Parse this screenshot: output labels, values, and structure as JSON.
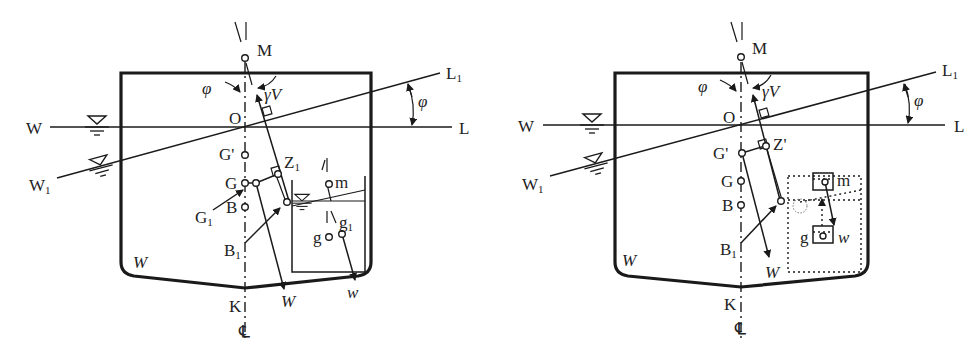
{
  "figures": [
    {
      "id": "left",
      "description": "Ship heeled with free-surface liquid tank (tank with sloshing liquid)",
      "labels": {
        "M": "M",
        "O": "O",
        "W": "W",
        "L": "L",
        "W1": "W",
        "W1_sub": "1",
        "L1": "L",
        "L1_sub": "1",
        "phi_left": "φ",
        "phi_right": "φ",
        "gammaV": "γV",
        "Gp": "G'",
        "G": "G",
        "G1": "G",
        "G1_sub": "1",
        "B": "B",
        "B1": "B",
        "B1_sub": "1",
        "Z1": "Z",
        "Z1_sub": "1",
        "m": "m",
        "g": "g",
        "g1": "g",
        "g1_sub": "1",
        "W_weight": "W",
        "w_weight": "w",
        "W_hull": "W",
        "K": "K",
        "CL": "℄"
      }
    },
    {
      "id": "right",
      "description": "Ship heeled with equivalent raised weight (free surface treated as weight shifted from g to m)",
      "labels": {
        "M": "M",
        "O": "O",
        "W": "W",
        "L": "L",
        "W1": "W",
        "W1_sub": "1",
        "L1": "L",
        "L1_sub": "1",
        "phi_left": "φ",
        "phi_right": "φ",
        "gammaV": "γV",
        "Gp": "G'",
        "G": "G",
        "B": "B",
        "B1": "B",
        "B1_sub": "1",
        "Zp": "Z'",
        "m": "m",
        "g": "g",
        "w_weight": "w",
        "W_weight": "W",
        "W_hull": "W",
        "K": "K",
        "CL": "℄"
      }
    }
  ],
  "colors": {
    "ink": "#1a1a1a",
    "background": "#ffffff"
  }
}
